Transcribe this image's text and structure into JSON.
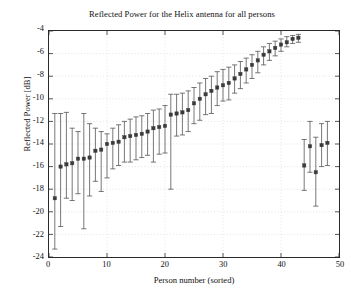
{
  "chart_data": {
    "type": "scatter",
    "title": "Reflected Power for the Helix antenna for all persons",
    "xlabel": "Person number (sorted)",
    "ylabel": "Reflected Power [dB]",
    "xlim": [
      0,
      50
    ],
    "ylim": [
      -24,
      -4
    ],
    "xticks": [
      0,
      10,
      20,
      30,
      40,
      50
    ],
    "yticks": [
      -24,
      -22,
      -20,
      -18,
      -16,
      -14,
      -12,
      -10,
      -8,
      -6,
      -4
    ],
    "grid": true,
    "legend": null,
    "marker": "square",
    "marker_color": "#3a3a3a",
    "errorbar_color": "#555555",
    "series_name": "Reflected power with error bars",
    "x": [
      1,
      2,
      3,
      4,
      5,
      6,
      7,
      8,
      9,
      10,
      11,
      12,
      13,
      14,
      15,
      16,
      17,
      18,
      19,
      20,
      21,
      22,
      23,
      24,
      25,
      26,
      27,
      28,
      29,
      30,
      31,
      32,
      33,
      34,
      35,
      36,
      37,
      38,
      39,
      40,
      41,
      42,
      43,
      44,
      45,
      46,
      47,
      48
    ],
    "y": [
      -18.8,
      -16.0,
      -15.8,
      -15.7,
      -15.3,
      -15.3,
      -15.2,
      -14.6,
      -14.5,
      -14.0,
      -13.9,
      -13.8,
      -13.4,
      -13.3,
      -13.2,
      -13.1,
      -12.9,
      -12.6,
      -12.5,
      -12.4,
      -11.4,
      -11.3,
      -11.2,
      -11.0,
      -10.4,
      -10.0,
      -9.6,
      -9.3,
      -9.0,
      -8.8,
      -8.6,
      -8.2,
      -7.8,
      -7.4,
      -7.0,
      -6.6,
      -6.1,
      -5.8,
      -5.5,
      -5.2,
      -5.0,
      -4.7,
      -4.6,
      -15.9,
      -14.2,
      -16.5,
      -14.1,
      -13.9
    ],
    "yerr_low": [
      -23.3,
      -21.3,
      -18.8,
      -19.0,
      -18.4,
      -21.5,
      -18.6,
      -17.3,
      -18.2,
      -17.0,
      -16.2,
      -15.9,
      -15.6,
      -15.6,
      -15.4,
      -15.2,
      -15.0,
      -15.6,
      -14.9,
      -14.8,
      -18.0,
      -13.3,
      -13.2,
      -12.9,
      -12.2,
      -11.9,
      -11.4,
      -11.3,
      -10.6,
      -10.2,
      -10.1,
      -9.5,
      -9.1,
      -8.6,
      -8.2,
      -7.7,
      -7.0,
      -6.6,
      -6.2,
      -5.8,
      -5.4,
      -5.1,
      -5.0,
      -18.1,
      -16.5,
      -19.5,
      -16.0,
      -15.9
    ],
    "yerr_high": [
      -11.3,
      -11.3,
      -11.2,
      -12.6,
      -12.9,
      -11.3,
      -12.2,
      -12.6,
      -12.9,
      -13.1,
      -12.6,
      -12.3,
      -12.0,
      -11.8,
      -11.6,
      -11.5,
      -11.3,
      -11.0,
      -10.9,
      -10.6,
      -9.6,
      -9.6,
      -9.5,
      -9.3,
      -9.0,
      -8.6,
      -8.2,
      -8.0,
      -7.6,
      -7.4,
      -7.2,
      -7.0,
      -6.7,
      -6.4,
      -6.1,
      -5.8,
      -5.4,
      -5.1,
      -4.9,
      -4.7,
      -4.5,
      -4.4,
      -4.3,
      -13.6,
      -12.0,
      -13.4,
      -12.2,
      -12.0
    ]
  }
}
